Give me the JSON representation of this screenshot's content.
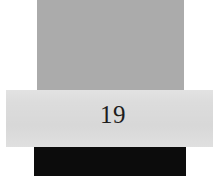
{
  "page": {
    "name": "scanned-page-fragment",
    "width": 223,
    "height": 195,
    "background_color": "#ffffff"
  },
  "blocks": {
    "upper": {
      "name": "upper-gray-block",
      "color": "#ababab",
      "x": 37,
      "y": 0,
      "width": 147,
      "height": 91
    },
    "band": {
      "name": "light-gray-band",
      "color": "#dcdcdc",
      "x": 6,
      "y": 90,
      "width": 207,
      "height": 57
    },
    "black": {
      "name": "black-bar",
      "color": "#0c0c0c",
      "x": 34,
      "y": 147,
      "width": 152,
      "height": 29
    }
  },
  "page_number": {
    "text": "19",
    "color": "#1d1d1d",
    "x": 98,
    "y": 101
  }
}
